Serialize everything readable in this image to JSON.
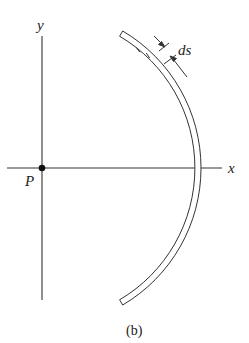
{
  "figure": {
    "caption": "(b)",
    "axes": {
      "x_label": "x",
      "y_label": "y"
    },
    "point": {
      "label": "P"
    },
    "element": {
      "label": "ds"
    }
  },
  "colors": {
    "stroke": "#333333",
    "background": "#ffffff"
  }
}
